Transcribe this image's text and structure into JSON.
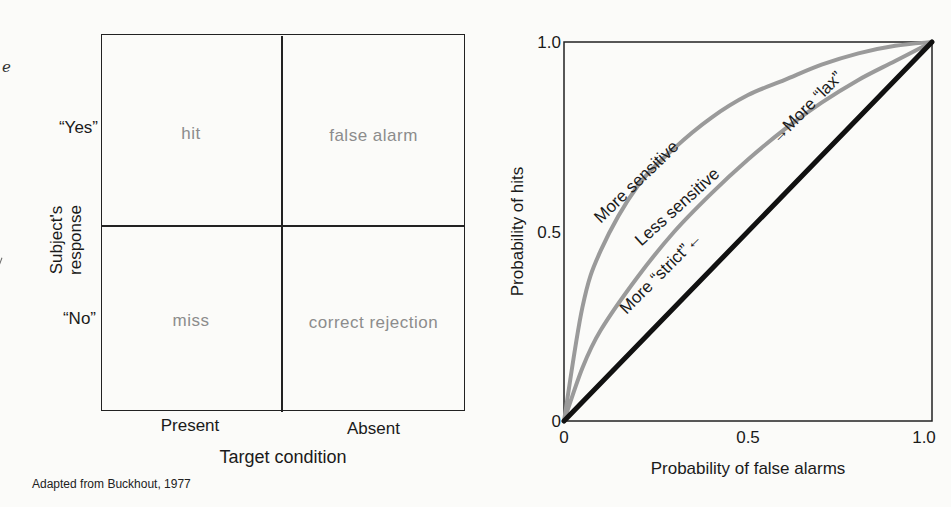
{
  "fragments": {
    "left_edge_letter": "e"
  },
  "matrix": {
    "row_labels": [
      "“Yes”",
      "“No”"
    ],
    "column_labels": [
      "Present",
      "Absent"
    ],
    "y_axis_title_line1": "Subject's",
    "y_axis_title_line2": "response",
    "x_axis_title": "Target condition",
    "cells": {
      "yes_present": "hit",
      "yes_absent": "false alarm",
      "no_present": "miss",
      "no_absent": "correct rejection"
    },
    "cell_text_color": "#8c8c8c"
  },
  "caption": "Adapted from Buckhout, 1977",
  "chart_data": {
    "type": "line",
    "title": "",
    "xlabel": "Probability of false alarms",
    "ylabel": "Probability of hits",
    "xlim": [
      0,
      1
    ],
    "ylim": [
      0,
      1
    ],
    "x_ticks": [
      "0",
      "0.5",
      "1.0"
    ],
    "y_ticks": [
      "0",
      "0.5",
      "1.0"
    ],
    "grid": false,
    "series": [
      {
        "name": "More sensitive",
        "color": "#9a9a9a",
        "x": [
          0,
          0.05,
          0.1,
          0.2,
          0.3,
          0.4,
          0.5,
          0.6,
          0.7,
          0.8,
          0.9,
          1.0
        ],
        "y": [
          0,
          0.3,
          0.45,
          0.62,
          0.72,
          0.8,
          0.86,
          0.9,
          0.94,
          0.97,
          0.99,
          1.0
        ]
      },
      {
        "name": "Less sensitive",
        "color": "#9a9a9a",
        "x": [
          0,
          0.05,
          0.1,
          0.2,
          0.3,
          0.4,
          0.5,
          0.6,
          0.7,
          0.8,
          0.9,
          1.0
        ],
        "y": [
          0,
          0.14,
          0.24,
          0.38,
          0.5,
          0.6,
          0.69,
          0.77,
          0.84,
          0.9,
          0.95,
          1.0
        ]
      },
      {
        "name": "Chance",
        "color": "#111111",
        "x": [
          0,
          1
        ],
        "y": [
          0,
          1
        ]
      }
    ],
    "annotations": [
      {
        "text": "More sensitive",
        "at": [
          0.1,
          0.52
        ]
      },
      {
        "text": "Less sensitive",
        "at": [
          0.21,
          0.46
        ]
      },
      {
        "text": "→More “lax”",
        "at": [
          0.58,
          0.73
        ]
      },
      {
        "text": "More “strict”←",
        "at": [
          0.17,
          0.28
        ]
      }
    ]
  }
}
